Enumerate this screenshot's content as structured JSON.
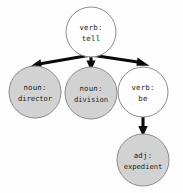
{
  "diagram": {
    "type": "dependency-parse-tree",
    "background_color": "#fdfdfd",
    "node_stroke_color": "#8c8c8c",
    "edge_color": "#0a0a0a",
    "fill_colors": {
      "root_and_verb": "#fefefe",
      "highlighted": "#d2d2d2"
    },
    "nodes": [
      {
        "id": "root",
        "pos_label": "verb:",
        "word_label": "tell",
        "fill": "white",
        "cx": 91,
        "cy": 32,
        "r": 25
      },
      {
        "id": "director",
        "pos_label": "noun:",
        "word_label": "director",
        "fill": "gray",
        "cx": 35,
        "cy": 92,
        "r": 26
      },
      {
        "id": "division",
        "pos_label": "noun:",
        "word_label": "division",
        "fill": "gray",
        "cx": 91,
        "cy": 93,
        "r": 26
      },
      {
        "id": "be",
        "pos_label": "verb:",
        "word_label": "be",
        "fill": "white",
        "cx": 143,
        "cy": 92,
        "r": 25
      },
      {
        "id": "expedient",
        "pos_label": "adj:",
        "word_label": "expedient",
        "fill": "gray",
        "cx": 143,
        "cy": 160,
        "r": 26
      }
    ],
    "edges": [
      {
        "id": "root-to-director",
        "from": "root",
        "to": "director"
      },
      {
        "id": "root-to-division",
        "from": "root",
        "to": "division"
      },
      {
        "id": "root-to-be",
        "from": "root",
        "to": "be"
      },
      {
        "id": "be-to-expedient",
        "from": "be",
        "to": "expedient"
      }
    ]
  }
}
